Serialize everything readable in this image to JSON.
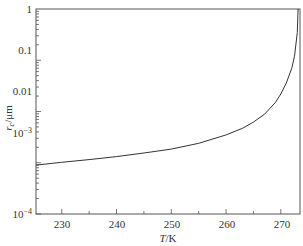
{
  "chart_data": {
    "type": "line",
    "title": "",
    "xlabel": "T/K",
    "ylabel": "r_c/μm",
    "xlim": [
      225.3,
      273.5
    ],
    "ylim": [
      0.0001,
      1
    ],
    "yscale": "log",
    "x_ticks": [
      "230",
      "240",
      "250",
      "260",
      "270"
    ],
    "y_ticks": [
      "10^-4",
      "10^-3",
      "0.01",
      "0.1",
      "1"
    ],
    "grid": false,
    "legend": null,
    "series": [
      {
        "name": "r_c",
        "x": [
          225.3,
          230,
          235,
          240,
          245,
          250,
          255,
          260,
          263,
          265,
          267,
          269,
          270,
          271,
          272,
          272.5,
          273,
          273.15
        ],
        "y": [
          0.0009,
          0.00102,
          0.00115,
          0.00132,
          0.00155,
          0.00185,
          0.0024,
          0.0035,
          0.0047,
          0.0062,
          0.0088,
          0.015,
          0.022,
          0.036,
          0.07,
          0.12,
          0.35,
          1.0
        ]
      }
    ]
  }
}
